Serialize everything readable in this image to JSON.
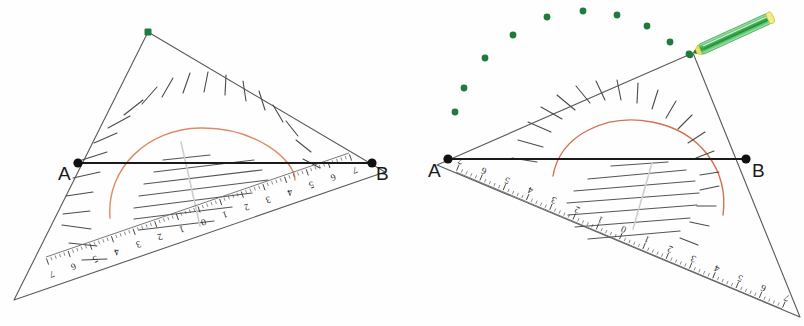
{
  "canvas": {
    "width": 804,
    "height": 326,
    "background": "#fefefe"
  },
  "scene": {
    "title": "Hand-drawn geometry: protractor placed on segment AB, two positions",
    "paper_color": "#fefefe",
    "ink_color": "#3a3a3a",
    "segment_color": "#1a1a1a",
    "arc_color": "#e08a62",
    "dot_color": "#1f7a3d",
    "pencil_body_color": "#55c96a",
    "pencil_tip_color": "#e9e06a"
  },
  "figures": [
    {
      "id": "left",
      "name": "protractor-left",
      "caption": "Protractor aligned so its baseline lies along AB",
      "point_a": {
        "label": "A",
        "x": 78,
        "y": 163
      },
      "point_b": {
        "label": "B",
        "x": 372,
        "y": 163
      },
      "apex": {
        "x": 148,
        "y": 32,
        "marker": "green-square"
      },
      "segment": {
        "from": "A",
        "to": "B",
        "label": "AB"
      },
      "arc": {
        "color": "#e08a62",
        "start_deg": 198,
        "end_deg": 352
      },
      "center_line_color": "#cfcfcf",
      "protractor_scale": {
        "orientation": "inverted",
        "left_numbers": [
          "7",
          "6",
          "5",
          "4",
          "3",
          "2",
          "1"
        ],
        "zero": "0",
        "right_numbers": [
          "1",
          "2",
          "3",
          "4",
          "5",
          "6",
          "7"
        ],
        "unit": "cm"
      },
      "radial_ticks": 17,
      "chord_lines": 7
    },
    {
      "id": "right",
      "name": "protractor-right",
      "caption": "Protractor rotated; green pencil marks the apex; dotted trail above",
      "point_a": {
        "label": "A",
        "x": 448,
        "y": 159
      },
      "point_b": {
        "label": "B",
        "x": 746,
        "y": 159
      },
      "apex": {
        "x": 693,
        "y": 53,
        "marker": "pencil-nib"
      },
      "segment": {
        "from": "A",
        "to": "B",
        "label": "AB"
      },
      "arc": {
        "color": "#c4604a",
        "start_deg": 192,
        "end_deg": 64
      },
      "center_line_color": "#cfcfcf",
      "protractor_scale": {
        "orientation": "inverted",
        "left_numbers": [
          "7",
          "6",
          "5",
          "4",
          "3",
          "2",
          "1"
        ],
        "zero": "0",
        "right_numbers": [
          "1",
          "2",
          "3",
          "4",
          "5",
          "6",
          "7"
        ],
        "unit": "cm"
      },
      "radial_ticks": 17,
      "chord_lines": 7,
      "pencil": {
        "name": "green-pencil",
        "from": {
          "x": 693,
          "y": 53
        },
        "to": {
          "x": 770,
          "y": 18
        },
        "body_color": "#55c96a",
        "tip_color": "#e9e06a",
        "nib_color": "#1f7a3d"
      },
      "dot_trail": {
        "color": "#1f7a3d",
        "count": 10,
        "points": [
          {
            "x": 455,
            "y": 112
          },
          {
            "x": 464,
            "y": 88
          },
          {
            "x": 485,
            "y": 58
          },
          {
            "x": 513,
            "y": 35
          },
          {
            "x": 547,
            "y": 17
          },
          {
            "x": 583,
            "y": 11
          },
          {
            "x": 617,
            "y": 15
          },
          {
            "x": 647,
            "y": 26
          },
          {
            "x": 670,
            "y": 42
          },
          {
            "x": 689,
            "y": 54
          }
        ]
      }
    }
  ]
}
